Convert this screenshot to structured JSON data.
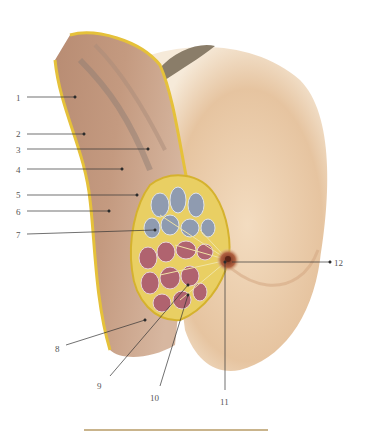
{
  "figure": {
    "type": "anatomical-illustration",
    "colors": {
      "skin": "#e9c9a6",
      "skin_shadow": "#c98e6a",
      "muscle": "#b08472",
      "fat": "#e5c13a",
      "gland_lobes_upper": "#8f9bb0",
      "gland_lobes_lower": "#b0636f",
      "areola": "#a9553a",
      "hair": "#7d715e",
      "leader_line": "#333333",
      "caption_rule": "#c9b48c"
    }
  },
  "labels": [
    {
      "id": "1",
      "text": "1",
      "x": 16,
      "y": 94,
      "line": [
        27,
        97,
        75,
        97
      ]
    },
    {
      "id": "2",
      "text": "2",
      "x": 16,
      "y": 130,
      "line": [
        27,
        134,
        84,
        134
      ]
    },
    {
      "id": "3",
      "text": "3",
      "x": 16,
      "y": 146,
      "line": [
        27,
        149,
        148,
        149
      ]
    },
    {
      "id": "4",
      "text": "4",
      "x": 16,
      "y": 166,
      "line": [
        27,
        169,
        122,
        169
      ]
    },
    {
      "id": "5",
      "text": "5",
      "x": 16,
      "y": 191,
      "line": [
        27,
        195,
        137,
        195
      ]
    },
    {
      "id": "6",
      "text": "6",
      "x": 16,
      "y": 208,
      "line": [
        27,
        211,
        109,
        211
      ]
    },
    {
      "id": "7",
      "text": "7",
      "x": 16,
      "y": 231,
      "line": [
        27,
        234,
        155,
        230
      ]
    },
    {
      "id": "8",
      "text": "8",
      "x": 55,
      "y": 345,
      "line": [
        66,
        345,
        145,
        320
      ]
    },
    {
      "id": "9",
      "text": "9",
      "x": 97,
      "y": 382,
      "line": [
        110,
        376,
        188,
        285
      ]
    },
    {
      "id": "10",
      "text": "10",
      "x": 150,
      "y": 394,
      "line": [
        160,
        386,
        188,
        295
      ]
    },
    {
      "id": "11",
      "text": "11",
      "x": 220,
      "y": 398,
      "line": [
        225,
        390,
        225,
        262
      ]
    },
    {
      "id": "12",
      "text": "12",
      "x": 334,
      "y": 259,
      "line": [
        232,
        262,
        330,
        262
      ]
    }
  ]
}
